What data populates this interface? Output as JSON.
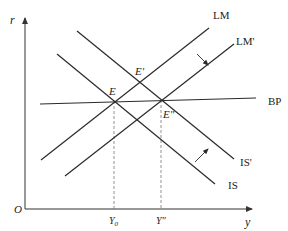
{
  "colors": {
    "line": "#2a2a2a",
    "axis": "#333333",
    "dashed": "#777777",
    "text": "#222222"
  },
  "axes": {
    "y_label": "r",
    "x_label": "y",
    "origin_label": "O",
    "origin": [
      25,
      209
    ],
    "y_axis_top": 18,
    "x_axis_right": 252
  },
  "curves": [
    {
      "id": "LM",
      "label": "LM",
      "from": [
        41,
        160
      ],
      "to": [
        209,
        28
      ],
      "label_pos": [
        213,
        19
      ]
    },
    {
      "id": "LM_prime",
      "label": "LM'",
      "from": [
        65,
        176
      ],
      "to": [
        234,
        44
      ],
      "label_pos": [
        236,
        45
      ]
    },
    {
      "id": "IS",
      "label": "IS",
      "from": [
        57,
        54
      ],
      "to": [
        215,
        184
      ],
      "label_pos": [
        228,
        189
      ]
    },
    {
      "id": "IS_prime",
      "label": "IS'",
      "from": [
        77,
        31
      ],
      "to": [
        234,
        159
      ],
      "label_pos": [
        240,
        166
      ]
    },
    {
      "id": "BP",
      "label": "BP",
      "from": [
        40,
        104
      ],
      "to": [
        256,
        98
      ],
      "label_pos": [
        268,
        105
      ]
    }
  ],
  "points": [
    {
      "id": "E",
      "label": "E",
      "pos": [
        114,
        101
      ],
      "label_pos": [
        109,
        95
      ]
    },
    {
      "id": "E_prime",
      "label": "E'",
      "pos": [
        140,
        83
      ],
      "label_pos": [
        135,
        75
      ]
    },
    {
      "id": "E_double_prime",
      "label": "E\"",
      "pos": [
        161,
        100
      ],
      "label_pos": [
        163,
        118
      ]
    }
  ],
  "x_ticks": [
    {
      "label": "Y",
      "subscript": "0",
      "x": 114
    },
    {
      "label": "Y\"",
      "subscript": "",
      "x": 161
    }
  ],
  "shift_arrows": [
    {
      "id": "lm-shift",
      "from": [
        197,
        54
      ],
      "to": [
        208,
        65
      ]
    },
    {
      "id": "is-shift",
      "from": [
        195,
        162
      ],
      "to": [
        208,
        149
      ]
    }
  ]
}
